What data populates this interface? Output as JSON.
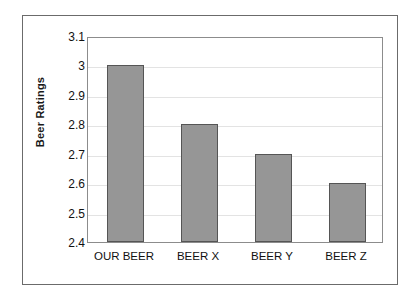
{
  "chart_data": {
    "type": "bar",
    "title": "",
    "subtitle": "",
    "xlabel": "",
    "ylabel": "Beer Ratings",
    "categories": [
      "OUR BEER",
      "BEER X",
      "BEER Y",
      "BEER Z"
    ],
    "values": [
      3.0,
      2.8,
      2.7,
      2.6
    ],
    "series": [
      {
        "name": "Beer Ratings",
        "values": [
          3.0,
          2.8,
          2.7,
          2.6
        ]
      }
    ],
    "ylim": [
      2.4,
      3.1
    ],
    "ytick_step": 0.1,
    "ytick_labels": [
      "3.1",
      "3",
      "2.9",
      "2.8",
      "2.7",
      "2.6",
      "2.5",
      "2.4"
    ],
    "ytick_values": [
      3.1,
      3.0,
      2.9,
      2.8,
      2.7,
      2.6,
      2.5,
      2.4
    ],
    "xlim_categories": 4,
    "grid": true,
    "grid_axis": "y",
    "legend": false,
    "legend_position": "none",
    "annotations": [],
    "colors": {
      "bar_fill": "#969696",
      "bar_border": "#555555",
      "gridline": "#e3e3e3",
      "plot_border": "#8c8c8c",
      "figure_border": "#6b6b6b",
      "background": "#ffffff",
      "text": "#111111"
    }
  }
}
